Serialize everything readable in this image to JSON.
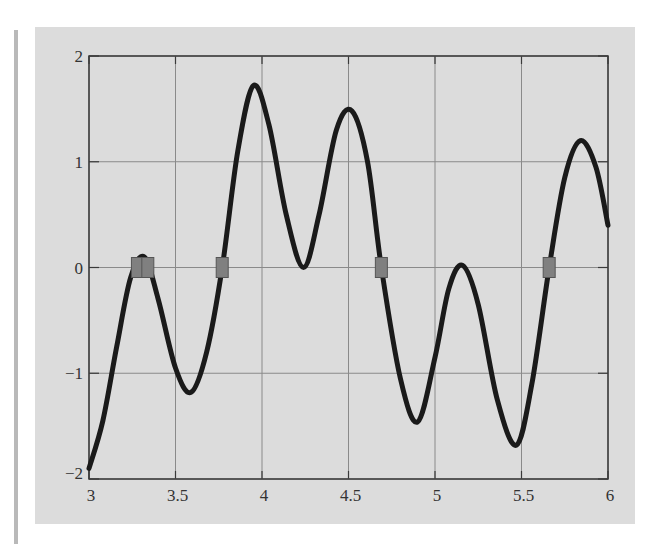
{
  "chart_data": {
    "type": "line",
    "title": "",
    "xlabel": "",
    "ylabel": "",
    "xlim": [
      3,
      6
    ],
    "ylim": [
      -2,
      2
    ],
    "grid": true,
    "legend": null,
    "x_ticks": [
      3,
      3.5,
      4,
      4.5,
      5,
      5.5,
      6
    ],
    "x_tick_labels": [
      "3",
      "3.5",
      "4",
      "4.5",
      "5",
      "5.5",
      "6"
    ],
    "y_ticks": [
      2,
      1,
      0,
      -1,
      -2
    ],
    "y_tick_labels": [
      "2",
      "1",
      "0",
      "−1",
      "−2"
    ],
    "series": [
      {
        "name": "f(x)",
        "color": "#1a1a1a",
        "x": [
          3.0,
          3.08,
          3.16,
          3.24,
          3.32,
          3.4,
          3.5,
          3.59,
          3.68,
          3.77,
          3.86,
          3.95,
          4.04,
          4.14,
          4.24,
          4.33,
          4.43,
          4.52,
          4.61,
          4.69,
          4.8,
          4.9,
          5.0,
          5.08,
          5.16,
          5.25,
          5.36,
          5.47,
          5.56,
          5.66,
          5.75,
          5.84,
          5.93,
          6.0
        ],
        "y": [
          -1.9,
          -1.45,
          -0.75,
          -0.1,
          0.1,
          -0.3,
          -0.95,
          -1.18,
          -0.8,
          0.0,
          1.1,
          1.72,
          1.35,
          0.5,
          0.0,
          0.5,
          1.3,
          1.48,
          1.0,
          0.0,
          -1.05,
          -1.46,
          -0.85,
          -0.2,
          0.02,
          -0.35,
          -1.25,
          -1.68,
          -1.1,
          0.0,
          0.85,
          1.2,
          0.95,
          0.4
        ]
      }
    ],
    "markers": {
      "shape": "square",
      "color": "#808080",
      "points": [
        {
          "x": 3.28,
          "y": 0
        },
        {
          "x": 3.34,
          "y": 0
        },
        {
          "x": 3.77,
          "y": 0
        },
        {
          "x": 4.69,
          "y": 0
        },
        {
          "x": 5.66,
          "y": 0
        }
      ]
    }
  },
  "colors": {
    "panel_background": "#dcdcdc",
    "gridline": "#8a8a8a",
    "frame": "#3a3a3a",
    "curve": "#1a1a1a",
    "marker_fill": "#808080"
  }
}
